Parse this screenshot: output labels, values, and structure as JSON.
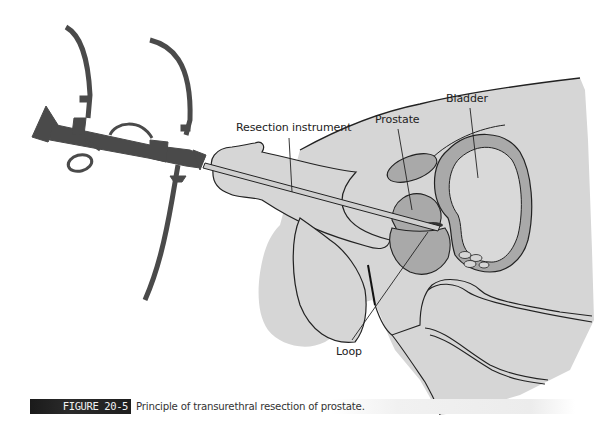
{
  "figure": {
    "labels": {
      "resection_instrument": "Resection instrument",
      "prostate": "Prostate",
      "bladder": "Bladder",
      "loop": "Loop"
    },
    "caption": {
      "tag": "FIGURE 20-5",
      "text": "Principle of transurethral resection of prostate."
    },
    "colors": {
      "instrument": "#4a4a4a",
      "body_fill": "#d6d6d6",
      "organ_fill": "#a9a9a9",
      "outline": "#222222",
      "caption_tag_bg": "#1e1e1e"
    }
  }
}
